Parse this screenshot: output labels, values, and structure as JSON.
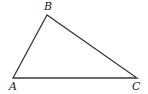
{
  "diagram": {
    "type": "triangle",
    "stroke_color": "#3a3a3a",
    "vertices": [
      {
        "name": "A",
        "label": "A",
        "x": 13,
        "y": 78,
        "label_x": 9,
        "label_y": 90
      },
      {
        "name": "B",
        "label": "B",
        "x": 47,
        "y": 15,
        "label_x": 44,
        "label_y": 10
      },
      {
        "name": "C",
        "label": "C",
        "x": 137,
        "y": 78,
        "label_x": 132,
        "label_y": 90
      }
    ],
    "edges": [
      [
        "A",
        "B"
      ],
      [
        "B",
        "C"
      ],
      [
        "C",
        "A"
      ]
    ]
  }
}
